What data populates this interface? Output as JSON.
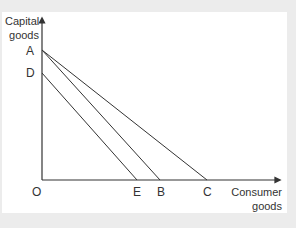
{
  "diagram": {
    "y_axis_label": [
      "Capital",
      "goods"
    ],
    "x_axis_label": [
      "Consumer",
      "goods"
    ],
    "origin": "O",
    "points": {
      "A": "A",
      "D": "D",
      "E": "E",
      "B": "B",
      "C": "C"
    },
    "lines": [
      {
        "from": "A",
        "to": "B"
      },
      {
        "from": "A",
        "to": "C"
      },
      {
        "from": "D",
        "to": "E"
      }
    ],
    "line_color": "#333333"
  }
}
